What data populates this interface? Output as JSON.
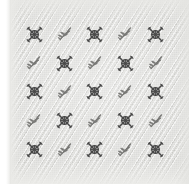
{
  "image": {
    "subject": "embroidered fabric swatch",
    "width": 189,
    "height": 184
  },
  "swatch": {
    "ground_color": "#dadad7",
    "selvedge_color": "#ffffff",
    "weave": "diagonal twill",
    "grid_rows": 5,
    "grid_cols": 5
  },
  "motifs": {
    "types": [
      {
        "key": "rosette",
        "icon_name": "circled-x-rosette-icon",
        "thread_color": "#3c3c3c",
        "description": "circled cross-stitch rosette with four diagonal arms"
      },
      {
        "key": "sprig",
        "icon_name": "leaf-sprig-icon",
        "thread_color": "#5a5a58",
        "description": "leafy sprig with paired leaves on a curved stem"
      }
    ],
    "layout": [
      [
        "rosette",
        "sprig",
        "rosette",
        "sprig",
        "rosette"
      ],
      [
        "sprig",
        "rosette",
        "sprig",
        "rosette",
        "sprig"
      ],
      [
        "rosette",
        "sprig",
        "rosette",
        "sprig",
        "rosette"
      ],
      [
        "sprig",
        "rosette",
        "sprig",
        "rosette",
        "sprig"
      ],
      [
        "rosette",
        "sprig",
        "rosette",
        "sprig",
        "rosette"
      ]
    ]
  }
}
